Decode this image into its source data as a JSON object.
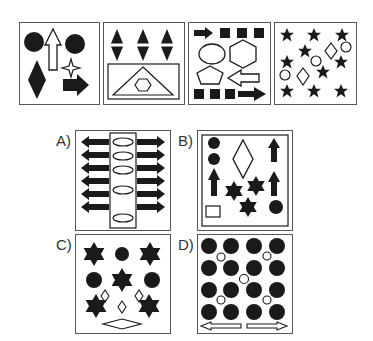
{
  "puzzle": {
    "type": "visual-reasoning-odd-one-out",
    "sequence_panels": [
      {
        "id": "panel-1",
        "shapes": [
          "filled-circle",
          "outline-up-arrow",
          "filled-circle",
          "filled-diamond",
          "outline-four-point-star",
          "filled-right-arrow"
        ]
      },
      {
        "id": "panel-2",
        "shapes": [
          "filled-split-diamond",
          "filled-split-diamond",
          "filled-split-diamond",
          "inner-rectangle",
          "outline-triangle",
          "outline-hexagon"
        ]
      },
      {
        "id": "panel-3",
        "shapes": [
          "filled-right-arrow",
          "filled-square",
          "filled-square",
          "filled-square",
          "outline-ellipse",
          "outline-hexagon",
          "outline-pentagon",
          "outline-left-arrow",
          "filled-square",
          "filled-square",
          "filled-square",
          "filled-right-arrow"
        ]
      },
      {
        "id": "panel-4",
        "shapes": [
          "filled-star x9",
          "outline-diamond x2",
          "outline-circle x3"
        ]
      }
    ],
    "options": [
      {
        "label": "A)",
        "shapes": [
          "filled-left-arrow x6",
          "outline-ellipse x5",
          "filled-right-arrow x6",
          "inner-rectangle"
        ]
      },
      {
        "label": "B)",
        "shapes": [
          "filled-circle x3",
          "outline-diamond",
          "filled-up-arrow x3",
          "filled-six-point-star x3",
          "outline-rectangle",
          "inner-border"
        ]
      },
      {
        "label": "C)",
        "shapes": [
          "filled-six-point-star x5",
          "filled-circle x3",
          "outline-diamond x3",
          "outline-wide-diamond"
        ]
      },
      {
        "label": "D)",
        "shapes": [
          "filled-circle x16",
          "outline-circle x5",
          "outline-left-arrow",
          "outline-right-arrow"
        ]
      }
    ]
  },
  "colors": {
    "ink": "#1a1a1a",
    "border": "#555555",
    "background": "#ffffff"
  }
}
